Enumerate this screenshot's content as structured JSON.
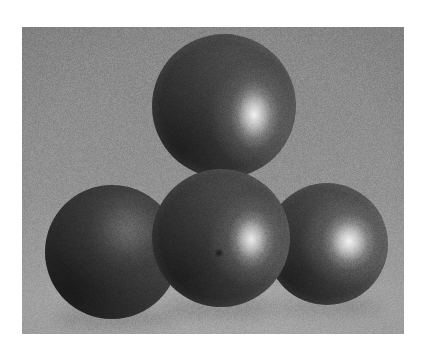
{
  "page": {
    "width": 429,
    "height": 358,
    "background_color": "#ffffff",
    "alt_text": "Four dark gray spheres clustered in a pyramid arrangement on a gray backdrop"
  },
  "photo": {
    "name": "spheres-photograph",
    "x": 22,
    "y": 27,
    "width": 382,
    "height": 307,
    "media": "grayscale-photograph",
    "subject": "four matte spheres / balls",
    "arrangement": "pyramid cluster, one on top and three below",
    "lighting": "single key light from upper right producing specular highlights on the right of each lit sphere",
    "grain": "visible film grain / scanned halftone noise",
    "background": {
      "name": "studio-backdrop",
      "type": "vertical-gradient",
      "top_color": "#8a8a8a",
      "mid_color": "#949494",
      "bottom_color": "#adadad",
      "floor_line_y": 0.9,
      "floor_color": "#a9a9a9"
    },
    "spheres": [
      {
        "id": "top",
        "name": "sphere-top",
        "label": "Top sphere",
        "cx": 224,
        "cy": 106,
        "r": 72,
        "base_color": "#4c4c4c",
        "shadow_color": "#2f2f2f",
        "rim_color": "#7c7c7c",
        "highlight": {
          "cx_pct": 71,
          "cy_pct": 56,
          "rx_pct": 17,
          "ry_pct": 24,
          "color": "#f2f2f2",
          "intensity": 0.95
        },
        "occluded_by": [
          "center"
        ],
        "z": 1
      },
      {
        "id": "left",
        "name": "sphere-left",
        "label": "Left sphere",
        "cx": 112,
        "cy": 252,
        "r": 67,
        "base_color": "#3e3e3e",
        "shadow_color": "#2a2a2a",
        "rim_color": "#5a5a5a",
        "highlight": {
          "cx_pct": 62,
          "cy_pct": 34,
          "rx_pct": 30,
          "ry_pct": 30,
          "color": "#6a6a6a",
          "intensity": 0.22
        },
        "occluded_by": [
          "center"
        ],
        "z": 2
      },
      {
        "id": "right",
        "name": "sphere-right",
        "label": "Right sphere",
        "cx": 327,
        "cy": 244,
        "r": 61,
        "base_color": "#4f4f4f",
        "shadow_color": "#313131",
        "rim_color": "#858585",
        "highlight": {
          "cx_pct": 68,
          "cy_pct": 48,
          "rx_pct": 22,
          "ry_pct": 24,
          "color": "#f4f4f4",
          "intensity": 1.0
        },
        "occluded_by": [
          "center"
        ],
        "z": 2
      },
      {
        "id": "center",
        "name": "sphere-center",
        "label": "Center front sphere",
        "cx": 221,
        "cy": 238,
        "r": 69,
        "base_color": "#4a4a4a",
        "shadow_color": "#2c2c2c",
        "rim_color": "#7a7a7a",
        "highlight": {
          "cx_pct": 72,
          "cy_pct": 51,
          "rx_pct": 17,
          "ry_pct": 22,
          "color": "#ededed",
          "intensity": 0.92
        },
        "blemish": {
          "name": "center-dot",
          "cx": 216,
          "cy": 250,
          "r": 3,
          "color": "#1f1f1f"
        },
        "occluded_by": [],
        "z": 4
      }
    ],
    "contact_shadows": [
      {
        "name": "shadow-left",
        "cx": 116,
        "cy": 318,
        "rx": 62,
        "ry": 11,
        "color": "#7d7d7d",
        "opacity": 0.5
      },
      {
        "name": "shadow-center",
        "cx": 222,
        "cy": 309,
        "rx": 58,
        "ry": 10,
        "color": "#767676",
        "opacity": 0.5
      },
      {
        "name": "shadow-right",
        "cx": 328,
        "cy": 307,
        "rx": 54,
        "ry": 10,
        "color": "#7d7d7d",
        "opacity": 0.45
      }
    ]
  }
}
